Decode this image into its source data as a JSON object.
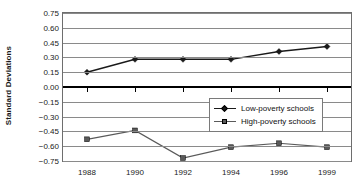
{
  "chart_data": {
    "type": "line",
    "title": "",
    "xlabel": "",
    "ylabel": "Standard Deviations",
    "categories": [
      "1988",
      "1990",
      "1992",
      "1994",
      "1996",
      "1999"
    ],
    "ylim": [
      -0.75,
      0.75
    ],
    "ytick_step": 0.15,
    "ytick_labels": [
      "0.75",
      "0.60",
      "0.45",
      "0.30",
      "0.15",
      "0.00",
      "-0.15",
      "-0.30",
      "-0.45",
      "-0.60",
      "-0.75"
    ],
    "ytick_values": [
      0.75,
      0.6,
      0.45,
      0.3,
      0.15,
      0.0,
      -0.15,
      -0.3,
      -0.45,
      -0.6,
      -0.75
    ],
    "grid": true,
    "zero_line_emphasized": true,
    "legend_position": "lower-right-inside",
    "series": [
      {
        "name": "Low-poverty schools",
        "marker": "diamond",
        "color": "#1a1a1a",
        "values": [
          0.15,
          0.28,
          0.28,
          0.28,
          0.36,
          0.41
        ]
      },
      {
        "name": "High-poverty schools",
        "marker": "square",
        "color": "#5a5a5a",
        "values": [
          -0.53,
          -0.44,
          -0.72,
          -0.61,
          -0.57,
          -0.61
        ]
      }
    ]
  },
  "legend": {
    "items": [
      {
        "label": "Low-poverty schools"
      },
      {
        "label": "High-poverty schools"
      }
    ]
  },
  "colors": {
    "low_poverty": "#1a1a1a",
    "high_poverty": "#5a5a5a",
    "gridline": "#8a8a8a",
    "zero_line": "#000000",
    "plot_border": "#6e6e6e",
    "background": "#ffffff"
  }
}
